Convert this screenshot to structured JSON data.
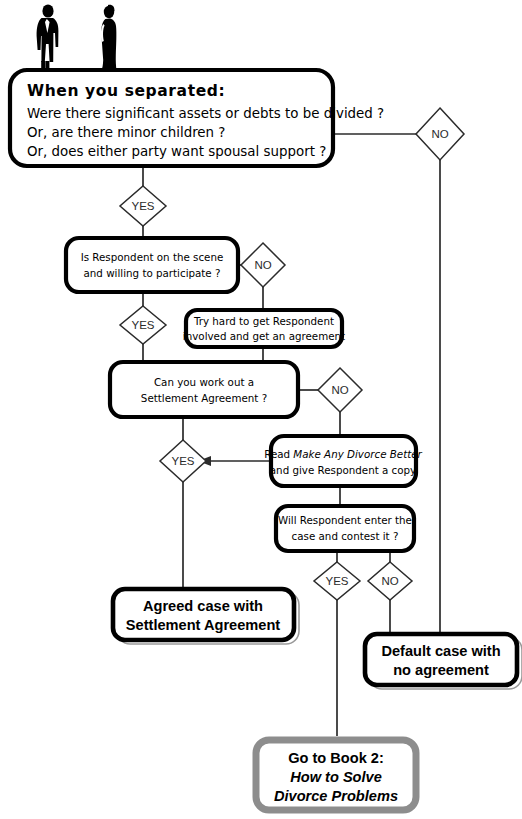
{
  "diagram": {
    "type": "flowchart",
    "illustration": {
      "name": "separated-couple-silhouettes",
      "figures": [
        "man-silhouette",
        "woman-silhouette"
      ]
    },
    "header_node": {
      "id": "when-you-separated",
      "title": "When you separated:",
      "lines": [
        "Were there significant assets or debts to be divided ?",
        "Or, are there minor children ?",
        "Or, does either party want spousal support ?"
      ]
    },
    "nodes": [
      {
        "id": "respondent-on-scene",
        "lines": [
          "Is Respondent on the scene",
          "and willing to participate ?"
        ]
      },
      {
        "id": "try-hard",
        "lines": [
          "Try hard to get Respondent",
          "involved and get an agreement"
        ]
      },
      {
        "id": "settlement-agreement",
        "lines": [
          "Can you work out a",
          "Settlement Agreement ?"
        ]
      },
      {
        "id": "read-book",
        "line1_pre": "Read ",
        "line1_italic": "Make Any Divorce Better",
        "line2": "and give Respondent a copy"
      },
      {
        "id": "contest-case",
        "lines": [
          "Will Respondent enter the",
          "case and contest it ?"
        ]
      }
    ],
    "terminals": [
      {
        "id": "agreed-case",
        "lines": [
          "Agreed case with",
          "Settlement Agreement"
        ],
        "style": "double-border"
      },
      {
        "id": "default-case",
        "lines": [
          "Default case with",
          "no agreement"
        ],
        "style": "double-border"
      },
      {
        "id": "go-to-book-2",
        "line1": "Go to Book 2:",
        "line2_italic": "How to Solve",
        "line3_italic": "Divorce Problems",
        "style": "gray-border"
      }
    ],
    "decisions": [
      {
        "id": "header-no",
        "label": "NO"
      },
      {
        "id": "header-yes",
        "label": "YES"
      },
      {
        "id": "respondent-no",
        "label": "NO"
      },
      {
        "id": "respondent-yes",
        "label": "YES"
      },
      {
        "id": "settlement-no",
        "label": "NO"
      },
      {
        "id": "settlement-yes",
        "label": "YES"
      },
      {
        "id": "contest-yes",
        "label": "YES"
      },
      {
        "id": "contest-no",
        "label": "NO"
      }
    ],
    "colors": {
      "line": "#2b2b2b",
      "box_border": "#000000",
      "gray_border": "#8d8d8d",
      "background": "#ffffff"
    }
  }
}
